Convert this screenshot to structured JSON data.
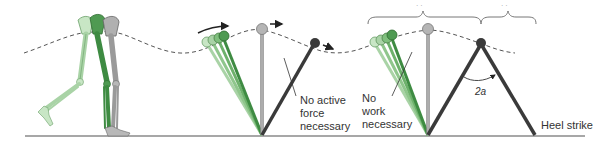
{
  "diagram": {
    "type": "gait-inverted-pendulum",
    "colors": {
      "ground": "#888888",
      "path": "#555555",
      "green_light": "#a9d3a6",
      "green_mid": "#7fbf7d",
      "green_dark": "#3e8b42",
      "gray_leg": "#9a9a9a",
      "dark_leg": "#3a3a3a",
      "text": "#333333"
    },
    "labels": {
      "no_active_force_1": "No active",
      "no_active_force_2": "force",
      "no_active_force_3": "necessary",
      "no_work_1": "No",
      "no_work_2": "work",
      "no_work_3": "necessary",
      "angle": "2a",
      "heel_strike": "Heel strike",
      "brace_left_label": "· ·",
      "brace_right_label": "· ·"
    },
    "panels": [
      {
        "name": "skeletal-legs",
        "description": "Overlaid leg skeletons in light green, dark green and gray during stance"
      },
      {
        "name": "pendulum-swing-force",
        "description": "Inverted pendulum legs with arrows showing forward motion of the center of mass"
      },
      {
        "name": "pendulum-step-angle",
        "description": "Inverted pendulum with step angle 2a and heel strike"
      }
    ]
  }
}
